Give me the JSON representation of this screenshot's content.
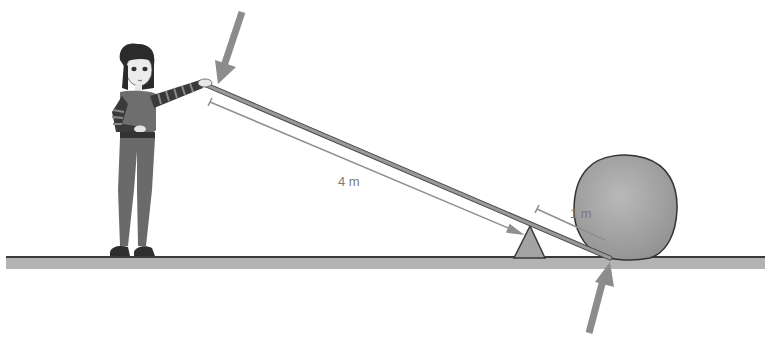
{
  "diagram": {
    "type": "lever",
    "labels": {
      "effort_arm": "4 m",
      "load_arm": "1 m"
    },
    "elements": {
      "person": "woman pushing lever",
      "lever": "long bar",
      "fulcrum": "triangle",
      "load": "boulder",
      "ground": "horizontal ground line"
    },
    "arrows": {
      "effort_force": "down-right arrow at woman's hand",
      "load_force": "up arrow under rock end"
    },
    "colors": {
      "ground": "#b3b3b3",
      "ground_edge": "#444444",
      "lever": "#8a8a8a",
      "arrow": "#8c8c8c",
      "rock": "#a8a8a8",
      "fulcrum": "#a0a0a0",
      "dimension": "#8f8f8f"
    }
  }
}
